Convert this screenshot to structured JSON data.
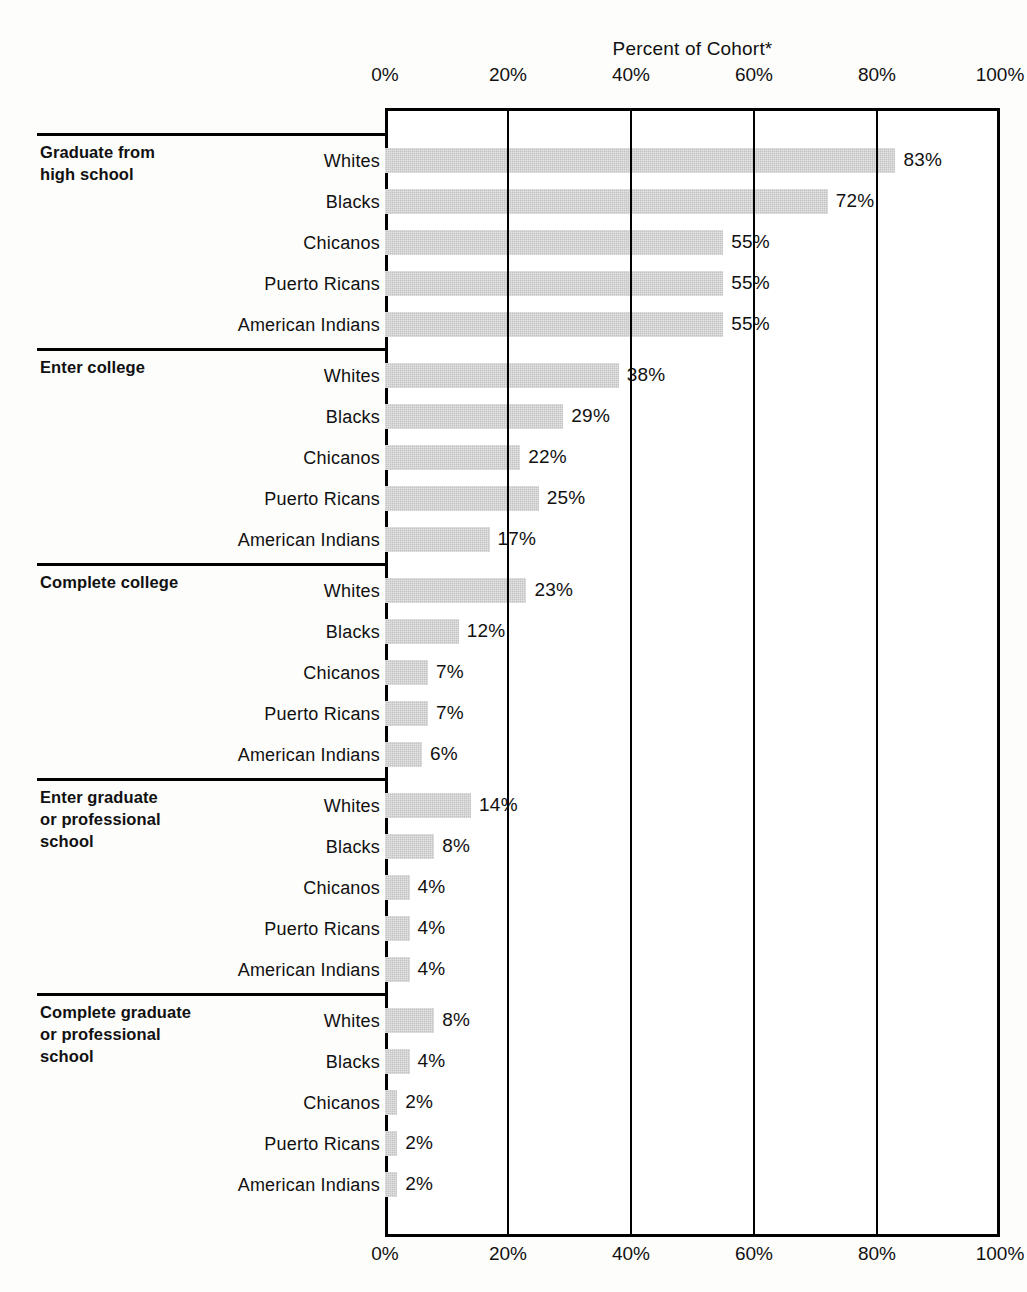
{
  "chart": {
    "title": "Percent of Cohort*",
    "axis_ticks": [
      "0%",
      "20%",
      "40%",
      "60%",
      "80%",
      "100%"
    ]
  },
  "chart_data": {
    "type": "bar",
    "title": "Percent of Cohort*",
    "xlabel": "Percent of Cohort*",
    "ylabel": "",
    "xlim": [
      0,
      100
    ],
    "grid": true,
    "legend": "none",
    "orientation": "horizontal",
    "categories": [
      "Whites",
      "Blacks",
      "Chicanos",
      "Puerto Ricans",
      "American Indians"
    ],
    "groups": [
      {
        "label": "Graduate from high school",
        "label_lines": [
          "Graduate from",
          "high school"
        ],
        "rows": [
          {
            "category": "Whites",
            "value": 83,
            "value_label": "83%"
          },
          {
            "category": "Blacks",
            "value": 72,
            "value_label": "72%"
          },
          {
            "category": "Chicanos",
            "value": 55,
            "value_label": "55%"
          },
          {
            "category": "Puerto Ricans",
            "value": 55,
            "value_label": "55%"
          },
          {
            "category": "American Indians",
            "value": 55,
            "value_label": "55%"
          }
        ]
      },
      {
        "label": "Enter college",
        "label_lines": [
          "Enter college"
        ],
        "rows": [
          {
            "category": "Whites",
            "value": 38,
            "value_label": "38%"
          },
          {
            "category": "Blacks",
            "value": 29,
            "value_label": "29%"
          },
          {
            "category": "Chicanos",
            "value": 22,
            "value_label": "22%"
          },
          {
            "category": "Puerto Ricans",
            "value": 25,
            "value_label": "25%"
          },
          {
            "category": "American Indians",
            "value": 17,
            "value_label": "17%"
          }
        ]
      },
      {
        "label": "Complete college",
        "label_lines": [
          "Complete college"
        ],
        "rows": [
          {
            "category": "Whites",
            "value": 23,
            "value_label": "23%"
          },
          {
            "category": "Blacks",
            "value": 12,
            "value_label": "12%"
          },
          {
            "category": "Chicanos",
            "value": 7,
            "value_label": "7%"
          },
          {
            "category": "Puerto Ricans",
            "value": 7,
            "value_label": "7%"
          },
          {
            "category": "American Indians",
            "value": 6,
            "value_label": "6%"
          }
        ]
      },
      {
        "label": "Enter graduate or professional school",
        "label_lines": [
          "Enter graduate",
          "or professional",
          "school"
        ],
        "rows": [
          {
            "category": "Whites",
            "value": 14,
            "value_label": "14%"
          },
          {
            "category": "Blacks",
            "value": 8,
            "value_label": "8%"
          },
          {
            "category": "Chicanos",
            "value": 4,
            "value_label": "4%"
          },
          {
            "category": "Puerto Ricans",
            "value": 4,
            "value_label": "4%"
          },
          {
            "category": "American Indians",
            "value": 4,
            "value_label": "4%"
          }
        ]
      },
      {
        "label": "Complete graduate or professional school",
        "label_lines": [
          "Complete graduate",
          "or professional",
          "school"
        ],
        "rows": [
          {
            "category": "Whites",
            "value": 8,
            "value_label": "8%"
          },
          {
            "category": "Blacks",
            "value": 4,
            "value_label": "4%"
          },
          {
            "category": "Chicanos",
            "value": 2,
            "value_label": "2%"
          },
          {
            "category": "Puerto Ricans",
            "value": 2,
            "value_label": "2%"
          },
          {
            "category": "American Indians",
            "value": 2,
            "value_label": "2%"
          }
        ]
      }
    ],
    "colors": {
      "bar": "#c3c3c3",
      "axis": "#000000",
      "text": "#111111",
      "background": "#fdfdfc"
    }
  }
}
